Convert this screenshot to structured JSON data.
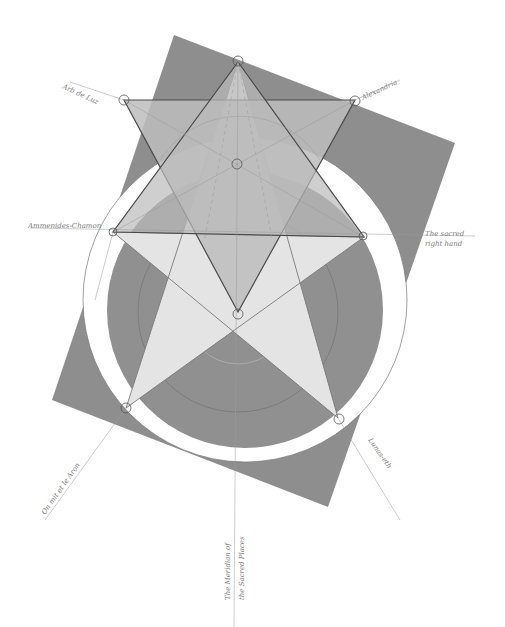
{
  "artwork": {
    "type": "pencil geometric drawing",
    "background": "#ffffff",
    "colors": {
      "dark_fill": "#8c8c8c",
      "mid_fill": "#a8a8a8",
      "light_fill": "#c9c9c9",
      "lightest_fill": "#e2e2e2",
      "line": "#555555",
      "faint_line": "#b0b0b0"
    }
  },
  "labels": {
    "top_left": "Arb de Luz",
    "top_right": "Alexandria",
    "left": "Ammenides-Chamon",
    "right_line1": "The sacred",
    "right_line2": "right hand",
    "bottom_left": "On mit et le Aron",
    "bottom_right": "Lunas-eth",
    "bottom_line1": "The Meridian of",
    "bottom_line2": "the Sacred Places"
  }
}
